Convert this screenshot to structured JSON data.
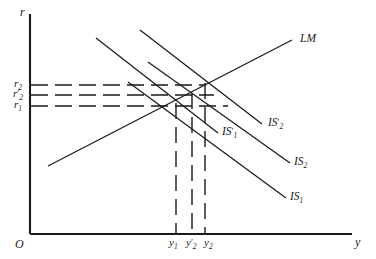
{
  "figure": {
    "type": "is-lm-diagram",
    "background": "#ffffff",
    "stroke_color": "#1a1a1a",
    "axes": {
      "origin_label": "O",
      "y_axis_label": "r",
      "x_axis_label": "y"
    },
    "rate_ticks": [
      {
        "id": "r2",
        "base": "r",
        "sub": "2",
        "prime": "",
        "label": "r₂"
      },
      {
        "id": "r2prime",
        "base": "r",
        "sub": "2",
        "prime": "′",
        "label": "r′₂"
      },
      {
        "id": "r1",
        "base": "r",
        "sub": "1",
        "prime": "",
        "label": "r₁"
      }
    ],
    "income_ticks": [
      {
        "id": "y1",
        "base": "y",
        "sub": "1",
        "prime": "",
        "label": "y₁"
      },
      {
        "id": "y2prime",
        "base": "y",
        "sub": "2",
        "prime": "′",
        "label": "y′₂"
      },
      {
        "id": "y2",
        "base": "y",
        "sub": "2",
        "prime": "",
        "label": "y₂"
      }
    ],
    "curves": [
      {
        "id": "lm",
        "base": "LM",
        "sub": "",
        "prime": "",
        "label": "LM",
        "slope": "upward"
      },
      {
        "id": "is1p",
        "base": "IS",
        "sub": "1",
        "prime": "′",
        "label": "IS′₁",
        "slope": "downward"
      },
      {
        "id": "is2p",
        "base": "IS",
        "sub": "2",
        "prime": "′",
        "label": "IS′₂",
        "slope": "downward"
      },
      {
        "id": "is2",
        "base": "IS",
        "sub": "2",
        "prime": "",
        "label": "IS₂",
        "slope": "downward"
      },
      {
        "id": "is1",
        "base": "IS",
        "sub": "1",
        "prime": "",
        "label": "IS₁",
        "slope": "downward"
      }
    ]
  }
}
